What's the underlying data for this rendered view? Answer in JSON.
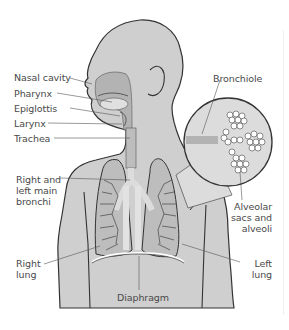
{
  "diagram": {
    "colors": {
      "body_fill": "#cfcfcf",
      "airway_fill": "#b3b3b3",
      "lung_fill": "#bdbdbd",
      "outline": "#333333",
      "leader_line": "#555555",
      "label_text": "#4a4a4a",
      "inset_fill": "#dcdcdc"
    },
    "labels": {
      "nasal_cavity": "Nasal cavity",
      "pharynx": "Pharynx",
      "epiglottis": "Epiglottis",
      "larynx": "Larynx",
      "trachea": "Trachea",
      "bronchi_line1": "Right and",
      "bronchi_line2": "left main",
      "bronchi_line3": "bronchi",
      "right_lung_line1": "Right",
      "right_lung_line2": "lung",
      "diaphragm": "Diaphragm",
      "bronchiole": "Bronchiole",
      "alveoli_line1": "Alveolar",
      "alveoli_line2": "sacs and",
      "alveoli_line3": "alveoli",
      "left_lung_line1": "Left",
      "left_lung_line2": "lung"
    }
  }
}
